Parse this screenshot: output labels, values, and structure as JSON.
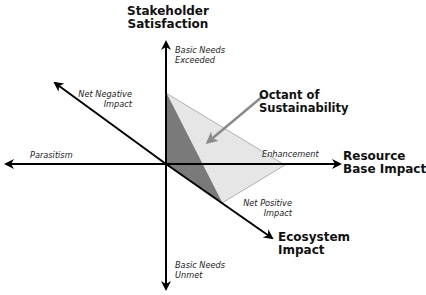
{
  "diagram": {
    "axes": {
      "vertical": {
        "title_line1": "Stakeholder",
        "title_line2": "Satisfaction",
        "positive_end_line1": "Basic Needs",
        "positive_end_line2": "Exceeded",
        "negative_end_line1": "Basic Needs",
        "negative_end_line2": "Unmet"
      },
      "horizontal": {
        "title_line1": "Resource",
        "title_line2": "Base Impact",
        "positive_end": "Enhancement",
        "negative_end": "Parasitism"
      },
      "diagonal": {
        "title_line1": "Ecosystem",
        "title_line2": "Impact",
        "positive_end_line1": "Net Positive",
        "positive_end_line2": "Impact",
        "negative_end_line1": "Net Negative",
        "negative_end_line2": "Impact"
      }
    },
    "callout": {
      "line1": "Octant of",
      "line2": "Sustainability"
    },
    "colors": {
      "axis": "#000000",
      "octant_light": "#e6e6e6",
      "octant_dark": "#7a7a7a",
      "octant_edge": "#b0b0b0",
      "callout_arrow": "#8a8a8a"
    }
  }
}
